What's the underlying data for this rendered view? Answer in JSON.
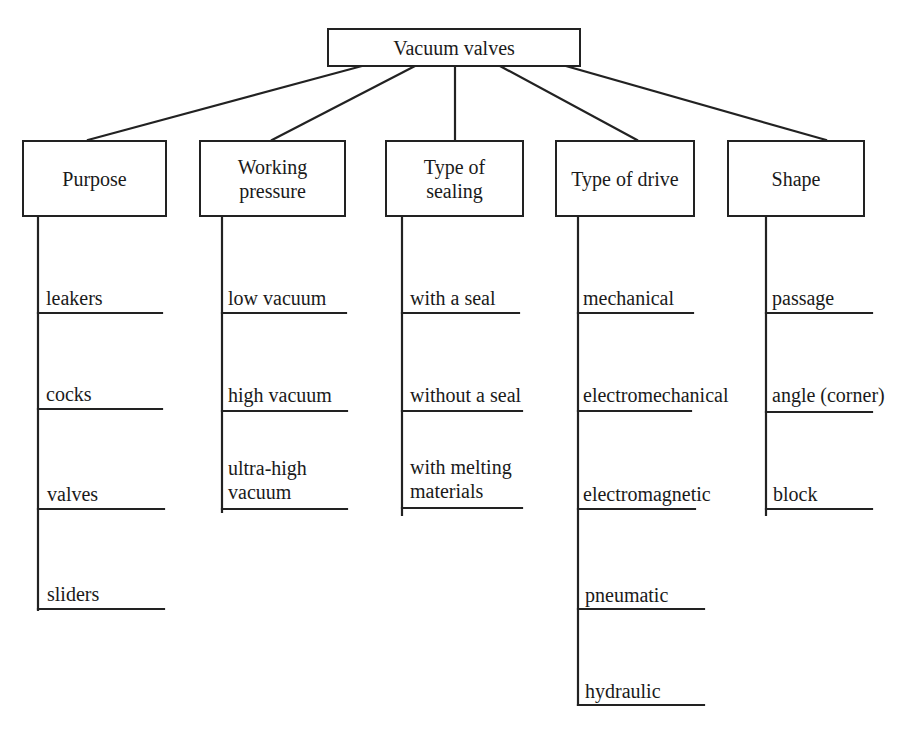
{
  "diagram": {
    "root": {
      "label": "Vacuum valves"
    },
    "categories": [
      {
        "label_line1": "Purpose",
        "label_line2": "",
        "items": [
          {
            "line1": "leakers",
            "line2": ""
          },
          {
            "line1": "cocks",
            "line2": ""
          },
          {
            "line1": "valves",
            "line2": ""
          },
          {
            "line1": "sliders",
            "line2": ""
          }
        ]
      },
      {
        "label_line1": "Working",
        "label_line2": "pressure",
        "items": [
          {
            "line1": "low vacuum",
            "line2": ""
          },
          {
            "line1": "high vacuum",
            "line2": ""
          },
          {
            "line1": "ultra-high",
            "line2": "vacuum"
          }
        ]
      },
      {
        "label_line1": "Type of",
        "label_line2": "sealing",
        "items": [
          {
            "line1": "with a seal",
            "line2": ""
          },
          {
            "line1": "without a seal",
            "line2": ""
          },
          {
            "line1": "with melting",
            "line2": "materials"
          }
        ]
      },
      {
        "label_line1": "Type of drive",
        "label_line2": "",
        "items": [
          {
            "line1": "mechanical",
            "line2": ""
          },
          {
            "line1": "electromechanical",
            "line2": ""
          },
          {
            "line1": "electromagnetic",
            "line2": ""
          },
          {
            "line1": "pneumatic",
            "line2": ""
          },
          {
            "line1": "hydraulic",
            "line2": ""
          }
        ]
      },
      {
        "label_line1": "Shape",
        "label_line2": "",
        "items": [
          {
            "line1": "passage",
            "line2": ""
          },
          {
            "line1": "angle (corner)",
            "line2": ""
          },
          {
            "line1": "block",
            "line2": ""
          }
        ]
      }
    ],
    "colors": {
      "line": "#222222",
      "text": "#1a1a1a",
      "background": "#ffffff"
    }
  }
}
